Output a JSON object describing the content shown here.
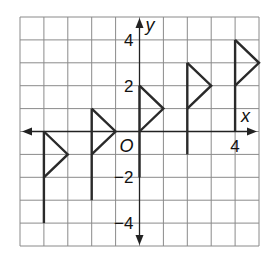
{
  "figure": {
    "type": "coordinate-grid",
    "x_range": [
      -5,
      5
    ],
    "y_range": [
      -5,
      5
    ],
    "axis_labels": {
      "x": "x",
      "y": "y",
      "origin": "O"
    },
    "tick_labels": {
      "x": [
        {
          "value": 4,
          "text": "4"
        }
      ],
      "y": [
        {
          "value": 4,
          "text": "4"
        },
        {
          "value": 2,
          "text": "2"
        },
        {
          "value": -2,
          "text": "−2"
        },
        {
          "value": -4,
          "text": "−4"
        }
      ]
    },
    "flags": [
      {
        "pole_x": -4,
        "pole_top": 0,
        "pole_bottom": -4,
        "tip": [
          -3,
          -1
        ],
        "tri_bottom": -2
      },
      {
        "pole_x": -2,
        "pole_top": 1,
        "pole_bottom": -3,
        "tip": [
          -1,
          0
        ],
        "tri_bottom": -1
      },
      {
        "pole_x": 0,
        "pole_top": 2,
        "pole_bottom": -2,
        "tip": [
          1,
          1
        ],
        "tri_bottom": 0
      },
      {
        "pole_x": 2,
        "pole_top": 3,
        "pole_bottom": -1,
        "tip": [
          3,
          2
        ],
        "tri_bottom": 1
      },
      {
        "pole_x": 4,
        "pole_top": 4,
        "pole_bottom": 0,
        "tip": [
          5,
          3
        ],
        "tri_bottom": 2
      }
    ],
    "colors": {
      "grid": "#8a8a8a",
      "axis": "#222222",
      "flag": "#2a2a2a"
    }
  }
}
